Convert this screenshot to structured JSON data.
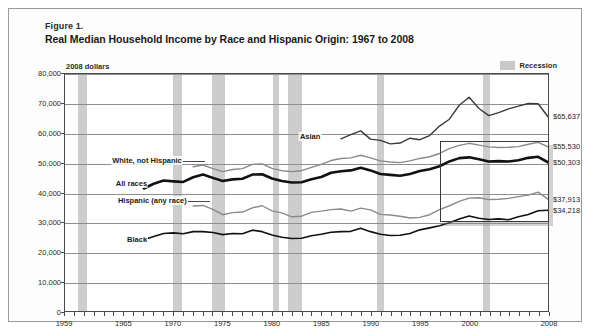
{
  "figure": {
    "number": "Figure 1.",
    "title": "Real Median Household Income by Race and Hispanic Origin: 1967 to 2008",
    "units_note": "2008 dollars"
  },
  "legend": {
    "recession_label": "Recession",
    "recession_color": "#cdcdcd"
  },
  "annotations": {
    "asian": "Asian",
    "white_not_hispanic": "White, not Hispanic",
    "all_races": "All races",
    "hispanic": "Hispanic (any race)",
    "black": "Black"
  },
  "end_labels": {
    "asian": "$65,637",
    "white_not_hispanic": "$55,530",
    "all_races": "$50,303",
    "hispanic": "$37,913",
    "black": "$34,218"
  },
  "chart_data": {
    "type": "line",
    "title": "Real Median Household Income by Race and Hispanic Origin: 1967 to 2008",
    "subtitle": "2008 dollars",
    "xlabel": "",
    "ylabel": "2008 dollars",
    "xlim": [
      1959,
      2008
    ],
    "ylim": [
      0,
      80000
    ],
    "grid": true,
    "legend_position": "inline-annotations",
    "ytick_labels": [
      "0",
      "10,000",
      "20,000",
      "30,000",
      "40,000",
      "50,000",
      "60,000",
      "70,000",
      "80,000"
    ],
    "ytick_values": [
      0,
      10000,
      20000,
      30000,
      40000,
      50000,
      60000,
      70000,
      80000
    ],
    "xtick_labels": [
      "1959",
      "1965",
      "1970",
      "1975",
      "1980",
      "1985",
      "1990",
      "1995",
      "2000",
      "2008"
    ],
    "xtick_values": [
      1959,
      1965,
      1970,
      1975,
      1980,
      1985,
      1990,
      1995,
      2000,
      2008
    ],
    "recession_bands": [
      [
        1960.3,
        1961.2
      ],
      [
        1969.9,
        1970.8
      ],
      [
        1973.9,
        1975.2
      ],
      [
        1980.0,
        1980.6
      ],
      [
        1981.5,
        1982.9
      ],
      [
        1990.5,
        1991.2
      ],
      [
        2001.2,
        2001.9
      ],
      [
        2007.9,
        2008.6
      ]
    ],
    "highlight_box": {
      "x_range": [
        1997.0,
        2008.0
      ],
      "y_range": [
        30200,
        57200
      ]
    },
    "series": [
      {
        "name": "Asian",
        "color": "#3a3a3a",
        "width": 1.4,
        "x": [
          1987,
          1988,
          1989,
          1990,
          1991,
          1992,
          1993,
          1994,
          1995,
          1996,
          1997,
          1998,
          1999,
          2000,
          2001,
          2002,
          2003,
          2004,
          2005,
          2006,
          2007,
          2008
        ],
        "values": [
          58200,
          59600,
          60900,
          58100,
          57700,
          56500,
          56800,
          58400,
          57900,
          59300,
          62500,
          64800,
          69500,
          72200,
          68400,
          66000,
          67000,
          68300,
          69200,
          70100,
          70000,
          65637
        ]
      },
      {
        "name": "White, not Hispanic",
        "color": "#8a8a8a",
        "width": 1.4,
        "x": [
          1972,
          1973,
          1974,
          1975,
          1976,
          1977,
          1978,
          1979,
          1980,
          1981,
          1982,
          1983,
          1984,
          1985,
          1986,
          1987,
          1988,
          1989,
          1990,
          1991,
          1992,
          1993,
          1994,
          1995,
          1996,
          1997,
          1998,
          1999,
          2000,
          2001,
          2002,
          2003,
          2004,
          2005,
          2006,
          2007,
          2008
        ],
        "values": [
          48800,
          49400,
          48200,
          47200,
          47900,
          48200,
          49600,
          49800,
          48300,
          47500,
          47200,
          47500,
          48600,
          49600,
          50900,
          51600,
          51800,
          52700,
          51800,
          50800,
          50400,
          50200,
          50800,
          51600,
          52200,
          53300,
          54900,
          56000,
          56700,
          56100,
          55500,
          55300,
          55400,
          55600,
          56400,
          57000,
          55530
        ]
      },
      {
        "name": "All races",
        "color": "#111111",
        "width": 2.6,
        "x": [
          1967,
          1968,
          1969,
          1970,
          1971,
          1972,
          1973,
          1974,
          1975,
          1976,
          1977,
          1978,
          1979,
          1980,
          1981,
          1982,
          1983,
          1984,
          1985,
          1986,
          1987,
          1988,
          1989,
          1990,
          1991,
          1992,
          1993,
          1994,
          1995,
          1996,
          1997,
          1998,
          1999,
          2000,
          2001,
          2002,
          2003,
          2004,
          2005,
          2006,
          2007,
          2008
        ],
        "values": [
          41500,
          43100,
          44200,
          43900,
          43700,
          45300,
          46200,
          45100,
          44000,
          44600,
          44800,
          46200,
          46300,
          44900,
          44000,
          43500,
          43600,
          44600,
          45400,
          46800,
          47300,
          47600,
          48500,
          47600,
          46400,
          46100,
          45800,
          46400,
          47400,
          48000,
          49000,
          50600,
          51700,
          52000,
          51300,
          50600,
          50700,
          50600,
          51000,
          51800,
          52200,
          50303
        ]
      },
      {
        "name": "Hispanic (any race)",
        "color": "#8a8a8a",
        "width": 1.4,
        "x": [
          1972,
          1973,
          1974,
          1975,
          1976,
          1977,
          1978,
          1979,
          1980,
          1981,
          1982,
          1983,
          1984,
          1985,
          1986,
          1987,
          1988,
          1989,
          1990,
          1991,
          1992,
          1993,
          1994,
          1995,
          1996,
          1997,
          1998,
          1999,
          2000,
          2001,
          2002,
          2003,
          2004,
          2005,
          2006,
          2007,
          2008
        ],
        "values": [
          35600,
          35800,
          34500,
          32700,
          33400,
          33600,
          35000,
          35700,
          34000,
          33300,
          32000,
          32200,
          33500,
          33900,
          34400,
          34600,
          33900,
          34900,
          34300,
          32800,
          32600,
          32200,
          31600,
          31800,
          32700,
          34400,
          35700,
          37200,
          38300,
          38400,
          37800,
          37900,
          38200,
          38800,
          39300,
          40300,
          37913
        ]
      },
      {
        "name": "Black",
        "color": "#111111",
        "width": 1.6,
        "x": [
          1967,
          1968,
          1969,
          1970,
          1971,
          1972,
          1973,
          1974,
          1975,
          1976,
          1977,
          1978,
          1979,
          1980,
          1981,
          1982,
          1983,
          1984,
          1985,
          1986,
          1987,
          1988,
          1989,
          1990,
          1991,
          1992,
          1993,
          1994,
          1995,
          1996,
          1997,
          1998,
          1999,
          2000,
          2001,
          2002,
          2003,
          2004,
          2005,
          2006,
          2007,
          2008
        ],
        "values": [
          24300,
          25400,
          26400,
          26600,
          26300,
          27000,
          27000,
          26700,
          26000,
          26400,
          26300,
          27500,
          27000,
          25900,
          25100,
          24700,
          24800,
          25600,
          26100,
          26800,
          27000,
          27100,
          28200,
          27000,
          26100,
          25700,
          25800,
          26400,
          27600,
          28300,
          29000,
          30000,
          31300,
          32300,
          31500,
          31100,
          31300,
          31000,
          32000,
          32800,
          34000,
          34218
        ]
      }
    ]
  }
}
